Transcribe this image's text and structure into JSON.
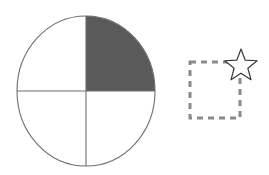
{
  "canvas": {
    "width": 269,
    "height": 175,
    "background": "#ffffff"
  },
  "colors": {
    "outline": "#6e6e6e",
    "shaded_fill": "#5a5a5a",
    "unshaded_fill": "#ffffff",
    "dashed_stroke": "#8a8a8a",
    "star_stroke": "#3a3a3a",
    "star_fill": "#ffffff"
  },
  "shapes": {
    "circle": {
      "name": "quartered-circle",
      "center_x": 86,
      "center_y": 91,
      "radius_x": 69,
      "radius_y": 75,
      "stroke_width": 1,
      "divider_lines": {
        "vertical_x": 86,
        "horizontal_y": 91
      },
      "quadrants": [
        {
          "position": "top-left",
          "shaded": false
        },
        {
          "position": "top-right",
          "shaded": true
        },
        {
          "position": "bottom-right",
          "shaded": false
        },
        {
          "position": "bottom-left",
          "shaded": false
        }
      ],
      "shaded_count": 1,
      "total_count": 4,
      "fraction_shaded": "1/4"
    },
    "dashed_square": {
      "name": "dashed-square",
      "x": 190,
      "y": 62,
      "width": 50,
      "height": 56,
      "stroke_width": 3,
      "dash_length": 6,
      "dash_gap": 5
    },
    "star": {
      "name": "five-pointed-star",
      "center_x": 241,
      "center_y": 66,
      "outer_radius": 17,
      "inner_radius": 7.2,
      "points": 5,
      "rotation_deg": -90,
      "stroke_width": 1.2
    }
  },
  "labels": {
    "figure_caption": ""
  }
}
